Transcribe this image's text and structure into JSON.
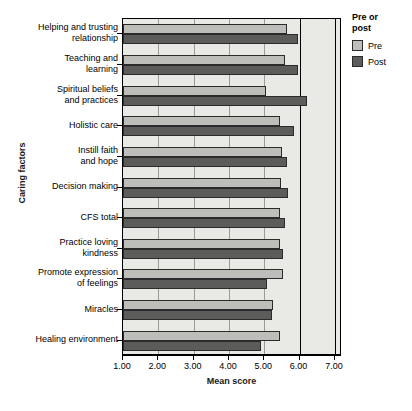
{
  "chart_data": {
    "type": "bar",
    "orientation": "horizontal",
    "title": "",
    "xlabel": "Mean score",
    "ylabel": "Caring factors",
    "xlim": [
      1.0,
      7.2
    ],
    "xticks": [
      "1.00",
      "2.00",
      "3.00",
      "4.00",
      "5.00",
      "6.00",
      "7.00"
    ],
    "xtick_values": [
      1,
      2,
      3,
      4,
      5,
      6,
      7
    ],
    "grid": true,
    "legend_position": "right",
    "legend_title": "Pre or post",
    "categories": [
      "Helping and trusting relationship",
      "Teaching and learning",
      "Spiritual beliefs and practices",
      "Holistic care",
      "Instill faith and hope",
      "Decision making",
      "CFS total",
      "Practice loving kindness",
      "Promote expression of feelings",
      "Miracles",
      "Healing environment"
    ],
    "category_lines": [
      [
        "Helping and trusting",
        "relationship"
      ],
      [
        "Teaching and",
        "learning"
      ],
      [
        "Spiritual beliefs",
        "and practices"
      ],
      [
        "Holistic care"
      ],
      [
        "Instill faith",
        "and hope"
      ],
      [
        "Decision making"
      ],
      [
        "CFS total"
      ],
      [
        "Practice loving",
        "kindness"
      ],
      [
        "Promote expression",
        "of feelings"
      ],
      [
        "Miracles"
      ],
      [
        "Healing environment"
      ]
    ],
    "series": [
      {
        "name": "Pre",
        "color": "#bdbdba",
        "values": [
          5.65,
          5.6,
          5.05,
          5.45,
          5.5,
          5.48,
          5.45,
          5.45,
          5.52,
          5.25,
          5.45
        ]
      },
      {
        "name": "Post",
        "color": "#5c5c5a",
        "values": [
          5.95,
          5.95,
          6.2,
          5.85,
          5.65,
          5.68,
          5.6,
          5.52,
          5.08,
          5.22,
          4.9
        ]
      }
    ]
  },
  "legend": {
    "title_line1": "Pre or",
    "title_line2": "post",
    "entries": [
      {
        "label": "Pre"
      },
      {
        "label": "Post"
      }
    ]
  },
  "axes": {
    "x_title": "Mean score",
    "y_title": "Caring factors"
  }
}
